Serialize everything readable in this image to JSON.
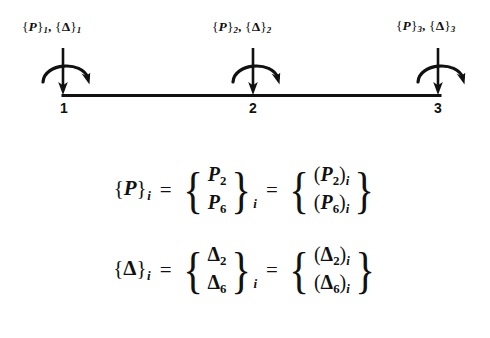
{
  "figure": {
    "beam": {
      "color": "#111111",
      "start_x": 63,
      "end_x": 440,
      "y": 95
    },
    "nodes": [
      {
        "number": "1",
        "x": 63,
        "load_label": {
          "force": "P",
          "displacement": "Δ",
          "index": "1",
          "text": "{P}1, {Δ}1"
        }
      },
      {
        "number": "2",
        "x": 253,
        "load_label": {
          "force": "P",
          "displacement": "Δ",
          "index": "2",
          "text": "{P}2, {Δ}2"
        }
      },
      {
        "number": "3",
        "x": 438,
        "load_label": {
          "force": "P",
          "displacement": "Δ",
          "index": "3",
          "text": "{P}3, {Δ}3"
        }
      }
    ],
    "arrows": {
      "force_arrow": "downward-force-arrow",
      "moment_arrow": "curved-moment-arrow"
    }
  },
  "equations": [
    {
      "name": "force-vector-equation",
      "lhs": {
        "symbol": "P",
        "braced": "{P}",
        "subscript": "i"
      },
      "equals": "=",
      "middle": {
        "entries": [
          "P2",
          "P6"
        ],
        "entry_symbols": [
          {
            "base": "P",
            "sub": "2"
          },
          {
            "base": "P",
            "sub": "6"
          }
        ],
        "outer_subscript": "i"
      },
      "equals2": "=",
      "right": {
        "entries": [
          "(P2)i",
          "(P6)i"
        ],
        "entry_symbols": [
          {
            "base": "P",
            "sub": "2",
            "outer": "i"
          },
          {
            "base": "P",
            "sub": "6",
            "outer": "i"
          }
        ]
      }
    },
    {
      "name": "displacement-vector-equation",
      "lhs": {
        "symbol": "Δ",
        "braced": "{Δ}",
        "subscript": "i"
      },
      "equals": "=",
      "middle": {
        "entries": [
          "Δ2",
          "Δ6"
        ],
        "entry_symbols": [
          {
            "base": "Δ",
            "sub": "2"
          },
          {
            "base": "Δ",
            "sub": "6"
          }
        ],
        "outer_subscript": "i"
      },
      "equals2": "=",
      "right": {
        "entries": [
          "(Δ2)i",
          "(Δ6)i"
        ],
        "entry_symbols": [
          {
            "base": "Δ",
            "sub": "2",
            "outer": "i"
          },
          {
            "base": "Δ",
            "sub": "6",
            "outer": "i"
          }
        ]
      }
    }
  ],
  "glyphs": {
    "brace_left": "{",
    "brace_right": "}",
    "paren_left": "(",
    "paren_right": ")",
    "comma": ",",
    "equals": "="
  }
}
